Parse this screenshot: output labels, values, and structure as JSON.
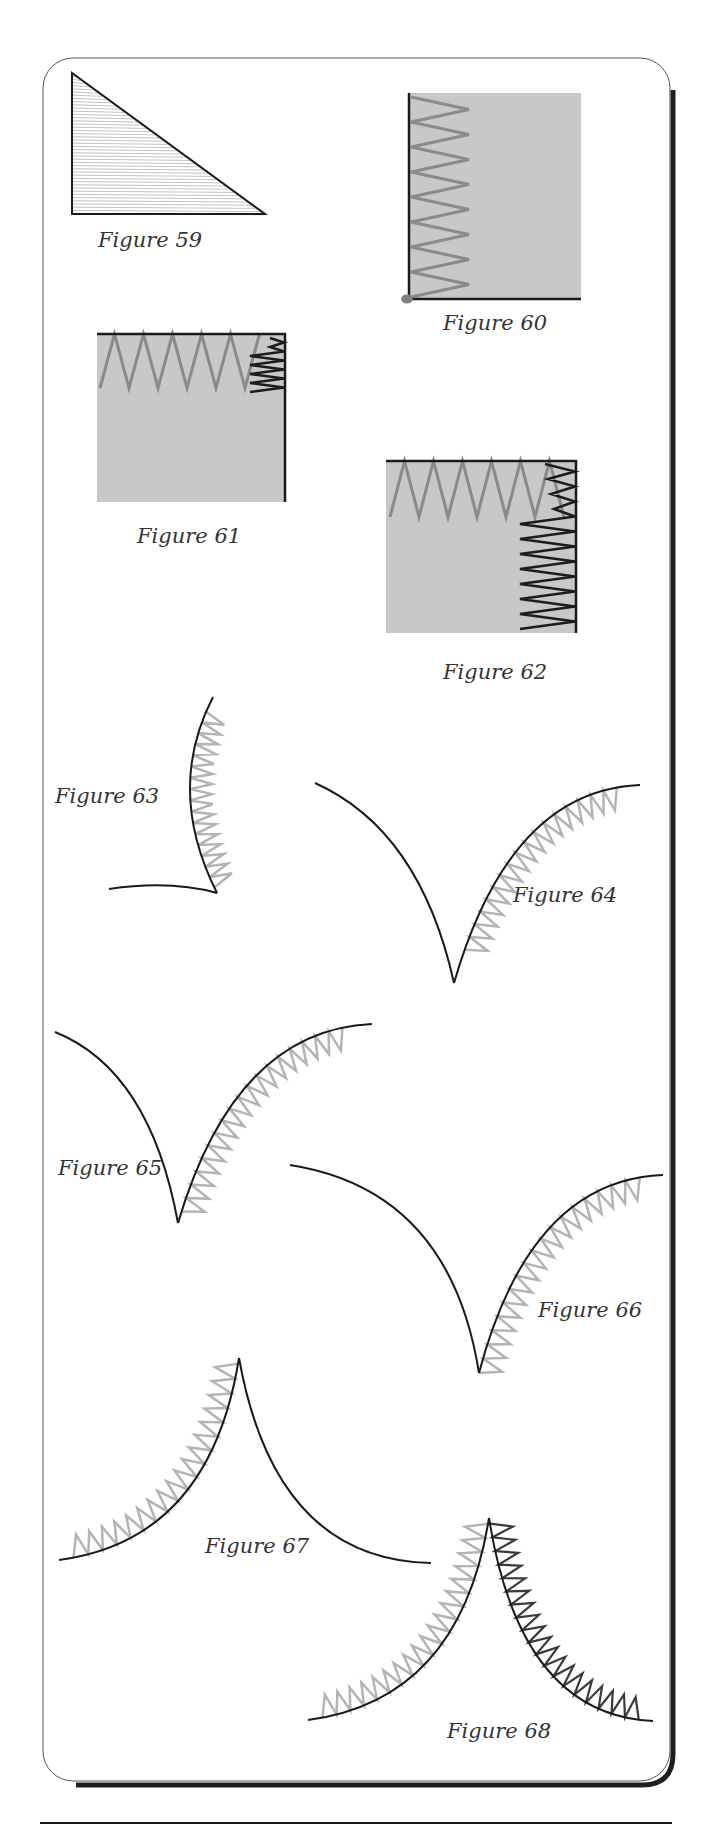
{
  "page": {
    "panel": {
      "x": 43,
      "y": 58,
      "width": 627,
      "height": 1723,
      "radius": 30
    },
    "footer_rule": {
      "x1": 40,
      "x2": 672,
      "y": 1823
    }
  },
  "colors": {
    "outline": "#1a1a1a",
    "fabric_fill": "#c8c8c8",
    "stitch_gray": "#8a8a8a",
    "stitch_light": "#b4b4b4",
    "stitch_dark": "#1c1c1c",
    "stitch_mid_dark": "#3a3a3a",
    "hatch": "#c4c4c4",
    "pivot_dot": "#808080",
    "shadow": "#1e1e1e"
  },
  "figures": [
    {
      "id": "59",
      "caption": "Figure 59",
      "label_x": 98,
      "label_y": 247,
      "description": "Right triangle filled with horizontal satin-stitch hatching"
    },
    {
      "id": "60",
      "caption": "Figure 60",
      "label_x": 443,
      "label_y": 330,
      "description": "Square with zigzag along left edge; pivot dot at bottom-left corner"
    },
    {
      "id": "61",
      "caption": "Figure 61",
      "label_x": 137,
      "label_y": 543,
      "description": "Square with zigzag along top edge meeting dense dark stitching at corner"
    },
    {
      "id": "62",
      "caption": "Figure 62",
      "label_x": 443,
      "label_y": 679,
      "description": "Square with gray zigzag along top and dark zigzag down right edge"
    },
    {
      "id": "63",
      "caption": "Figure 63",
      "label_x": 55,
      "label_y": 803,
      "description": "Concave curve with zigzag on inner side"
    },
    {
      "id": "64",
      "caption": "Figure 64",
      "label_x": 513,
      "label_y": 902,
      "description": "Inside point with zigzag along right curve"
    },
    {
      "id": "65",
      "caption": "Figure 65",
      "label_x": 58,
      "label_y": 1175,
      "description": "Inside point with zigzag along right curve continuing into point"
    },
    {
      "id": "66",
      "caption": "Figure 66",
      "label_x": 538,
      "label_y": 1317,
      "description": "Inside point with zigzag crossing to point"
    },
    {
      "id": "67",
      "caption": "Figure 67",
      "label_x": 205,
      "label_y": 1553,
      "description": "Outside point with zigzag along left curve"
    },
    {
      "id": "68",
      "caption": "Figure 68",
      "label_x": 447,
      "label_y": 1738,
      "description": "Outside point with gray zigzag on left curve and dark zigzag on right curve"
    }
  ]
}
